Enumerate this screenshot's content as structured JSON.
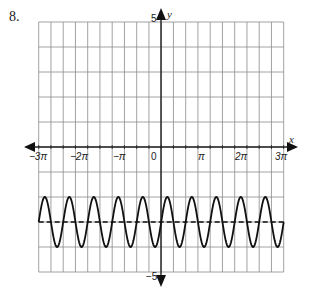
{
  "problem": {
    "number": "8."
  },
  "chart_data": {
    "type": "line",
    "title": "",
    "xlabel": "x",
    "ylabel": "y",
    "xlim_pi": [
      -3,
      3
    ],
    "ylim": [
      -5,
      5
    ],
    "grid": true,
    "grid_columns": 20,
    "grid_rows": 10,
    "x_tick_labels": [
      {
        "value_pi": -3,
        "label": "−3π"
      },
      {
        "value_pi": -2,
        "label": "−2π"
      },
      {
        "value_pi": -1,
        "label": "−π"
      },
      {
        "value_pi": 0,
        "label": "0"
      },
      {
        "value_pi": 1,
        "label": "π"
      },
      {
        "value_pi": 2,
        "label": "2π"
      },
      {
        "value_pi": 3,
        "label": "3π"
      }
    ],
    "y_tick_labels": [
      {
        "value": 5,
        "label": "5"
      },
      {
        "value": -5,
        "label": "−5"
      }
    ],
    "series": [
      {
        "name": "curve",
        "style": "solid",
        "function": "y = sin((10/3)(x + 3π)) − 3",
        "amplitude": 1,
        "midline": -3,
        "period_pi": 0.6,
        "periods_shown": 10,
        "max": -2,
        "min": -4,
        "domain_pi": [
          -3,
          3
        ]
      },
      {
        "name": "midline",
        "style": "dashed",
        "function": "y = −3",
        "value": -3,
        "domain_pi": [
          -3,
          3
        ]
      }
    ]
  },
  "labels": {
    "x_axis_name": "x",
    "y_axis_name": "y",
    "y_top": "5",
    "y_bottom": "−5",
    "x_ticks": [
      "−3π",
      "−2π",
      "−π",
      "0",
      "π",
      "2π",
      "3π"
    ]
  }
}
